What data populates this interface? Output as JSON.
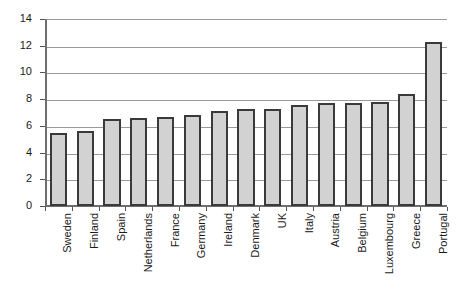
{
  "chart_data": {
    "type": "bar",
    "title": "",
    "subtitle": "",
    "xlabel": "",
    "ylabel": "",
    "ylim": [
      0,
      14
    ],
    "ytick_step": 2,
    "yticks": [
      0,
      2,
      4,
      6,
      8,
      10,
      12,
      14
    ],
    "ytick_labels": [
      "0",
      "2",
      "4",
      "6",
      "8",
      "10",
      "12",
      "14"
    ],
    "grid": "horizontal",
    "legend": "none",
    "categories": [
      "Sweden",
      "Finland",
      "Spain",
      "Netherlands",
      "France",
      "Germany",
      "Ireland",
      "Denmark",
      "UK",
      "Italy",
      "Austria",
      "Belgium",
      "Luxembourg",
      "Greece",
      "Portugal"
    ],
    "values": [
      5.5,
      5.6,
      6.5,
      6.6,
      6.7,
      6.8,
      7.1,
      7.3,
      7.3,
      7.6,
      7.7,
      7.7,
      7.8,
      8.4,
      12.3
    ],
    "bar_fill_color": "#d2d2d2",
    "bar_border_color": "#3a3a3a",
    "gridline_color": "#9a9a9a",
    "axis_color": "#6e6e6e",
    "background_color": "#ffffff"
  }
}
